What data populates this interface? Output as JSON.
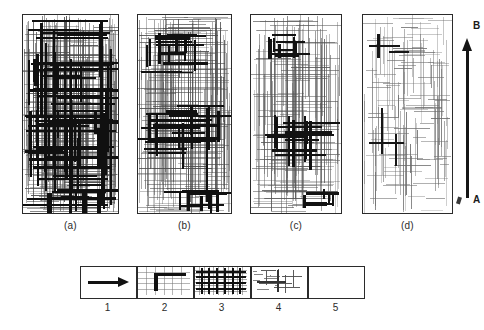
{
  "figure": {
    "panels": [
      {
        "id": "a",
        "label": "(a)",
        "x": 22,
        "y": 14,
        "w": 97,
        "h": 200,
        "fine_line_color": "#4a4a4a",
        "bold_line_color": "#101010",
        "fine_density": "very-high",
        "bold_density": "very-high",
        "description": "Densely developed orthogonal joint network; thick master joints pervade the whole block"
      },
      {
        "id": "b",
        "label": "(b)",
        "x": 137,
        "y": 14,
        "w": 95,
        "h": 200,
        "fine_line_color": "#4a4a4a",
        "bold_line_color": "#101010",
        "fine_density": "high",
        "bold_density": "high",
        "description": "Three clusters of thick joints on a dense background grid"
      },
      {
        "id": "c",
        "label": "(c)",
        "x": 250,
        "y": 14,
        "w": 92,
        "h": 200,
        "fine_line_color": "#555555",
        "bold_line_color": "#121212",
        "fine_density": "medium",
        "bold_density": "medium",
        "description": "Fewer thick joint clusters, moderately dense background grid"
      },
      {
        "id": "d",
        "label": "(d)",
        "x": 362,
        "y": 14,
        "w": 91,
        "h": 200,
        "fine_line_color": "#6a6a6a",
        "bold_line_color": "#161616",
        "fine_density": "low",
        "bold_density": "very-low",
        "description": "Sparse short fractures; only two isolated thick joint crosses"
      }
    ],
    "direction_axis": {
      "name": "a-to-b-direction-arrow",
      "top_label": "B",
      "bottom_label": "A",
      "direction": "upward",
      "x": 467,
      "top_y": 38,
      "bottom_y": 198,
      "color": "#151515"
    }
  },
  "legend": {
    "x": 80,
    "y": 266,
    "box_w": 55,
    "box_h": 31,
    "gap": 57,
    "items": [
      {
        "num": "1",
        "icon": "right-arrow",
        "meaning": "direction of increasing joint development"
      },
      {
        "num": "2",
        "icon": "thick-joint-corner",
        "meaning": "master joint (thick line)"
      },
      {
        "num": "3",
        "icon": "dense-joint-grid",
        "meaning": "densely jointed block"
      },
      {
        "num": "4",
        "icon": "sparse-joint-grid",
        "meaning": "sparsely jointed block"
      },
      {
        "num": "5",
        "icon": "empty-box",
        "meaning": "unjointed / massive block"
      }
    ]
  },
  "chart_data": {
    "type": "diagram",
    "title": "",
    "panel_ids": [
      "(a)",
      "(b)",
      "(c)",
      "(d)"
    ],
    "axis_labels": {
      "start": "A",
      "end": "B"
    },
    "series": [
      {
        "name": "fine joint density (relative)",
        "values": [
          100,
          78,
          55,
          28
        ]
      },
      {
        "name": "master (thick) joint density (relative)",
        "values": [
          100,
          55,
          32,
          8
        ]
      }
    ],
    "legend_entries": [
      "1",
      "2",
      "3",
      "4",
      "5"
    ]
  }
}
